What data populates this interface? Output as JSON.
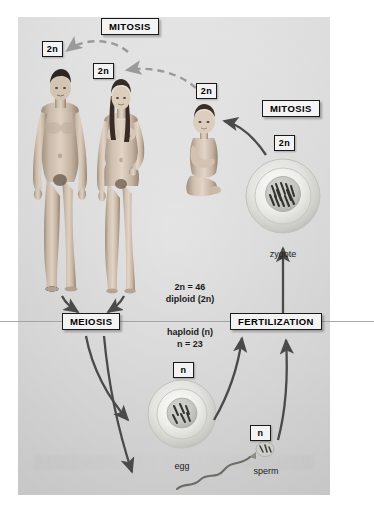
{
  "diagram": {
    "process_labels": {
      "mitosis_top": "MITOSIS",
      "mitosis_right": "MITOSIS",
      "meiosis": "MEIOSIS",
      "fertilization": "FERTILIZATION"
    },
    "ploidy_tags": {
      "adult_male": "2n",
      "adult_female": "2n",
      "child": "2n",
      "zygote": "2n",
      "egg": "n",
      "sperm": "n"
    },
    "ploidy_text": {
      "diploid_count": "2n = 46",
      "diploid_name": "diploid (2n)",
      "haploid_name": "haploid (n)",
      "haploid_count": "n = 23"
    },
    "cell_captions": {
      "zygote": "zygote",
      "egg": "egg",
      "sperm": "sperm"
    },
    "colors": {
      "panel_background": "#dcdcdc",
      "panel_background_lower": "#d2d2d2",
      "label_fill": "#f3f3f3",
      "label_border": "#1a1a1a",
      "solid_arrow": "#4a4a4a",
      "dashed_arrow": "#9a9a9a",
      "divider": "#9a9a9a",
      "skin": "#c9b7a6",
      "chromosome": "#3a3a3a"
    }
  }
}
